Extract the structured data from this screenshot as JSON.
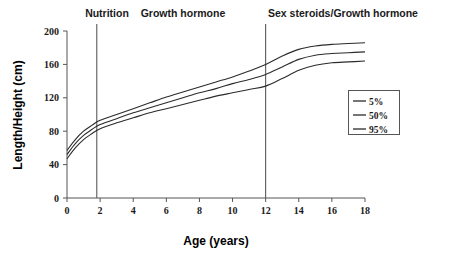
{
  "chart_data": {
    "type": "line",
    "title": "",
    "xlabel": "Age (years)",
    "ylabel": "Length/Height (cm)",
    "xlim": [
      0,
      18
    ],
    "ylim": [
      0,
      200
    ],
    "xticks": [
      "0",
      "2",
      "4",
      "6",
      "8",
      "10",
      "12",
      "14",
      "16",
      "18"
    ],
    "yticks": [
      "0",
      "40",
      "80",
      "120",
      "160",
      "200"
    ],
    "grid": false,
    "legend_position": "right-middle",
    "legend_entries": [
      "5%",
      "50%",
      "95%"
    ],
    "x": [
      0,
      0.5,
      1,
      1.5,
      2,
      3,
      4,
      5,
      6,
      7,
      8,
      9,
      10,
      11,
      12,
      13,
      14,
      15,
      16,
      17,
      18
    ],
    "series": [
      {
        "name": "95%",
        "values": [
          57,
          70,
          80,
          87,
          93,
          100,
          107,
          114,
          121,
          127,
          133,
          139,
          145,
          152,
          160,
          170,
          178,
          182,
          184,
          185,
          186
        ]
      },
      {
        "name": "50%",
        "values": [
          52,
          65,
          75,
          82,
          88,
          95,
          102,
          108,
          114,
          120,
          126,
          131,
          137,
          142,
          148,
          157,
          166,
          171,
          173,
          174,
          175
        ]
      },
      {
        "name": "5%",
        "values": [
          47,
          60,
          70,
          77,
          83,
          90,
          96,
          102,
          107,
          112,
          117,
          122,
          126,
          130,
          134,
          143,
          153,
          159,
          162,
          163,
          164
        ]
      }
    ],
    "annotations": [
      {
        "label": "Nutrition",
        "x_center": 0.9,
        "divider_x": 1.8
      },
      {
        "label": "Growth hormone",
        "x_center": 6.5,
        "divider_x": 12.0
      },
      {
        "label": "Sex steroids/Growth hormone",
        "x_center": 15.5,
        "divider_x": null
      }
    ],
    "dividers": [
      1.8,
      12.0
    ]
  },
  "colors": {
    "curve": "#2b2b2b",
    "axis": "#555555",
    "divider": "#4a4a4a",
    "text": "#1a1a1a",
    "background": "#ffffff"
  }
}
